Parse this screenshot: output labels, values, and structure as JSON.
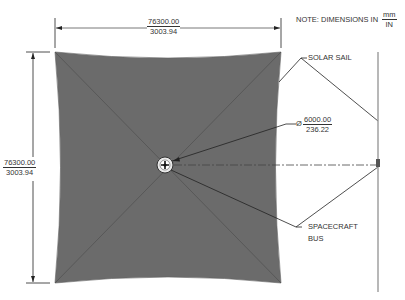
{
  "note": {
    "text": "NOTE: DIMENSIONS IN",
    "unit_top": "mm",
    "unit_bottom": "IN"
  },
  "dimensions": {
    "width": {
      "mm": "76300.00",
      "in": "3003.94"
    },
    "height": {
      "mm": "76300.00",
      "in": "3003.94"
    },
    "bus_diameter": {
      "symbol": "Ø",
      "mm": "6000.00",
      "in": "236.22"
    }
  },
  "callouts": {
    "solar_sail": "SOLAR SAIL",
    "spacecraft_bus_line1": "SPACECRAFT",
    "spacecraft_bus_line2": "BUS"
  },
  "colors": {
    "sail_fill": "#6b6b6b",
    "sail_diagonal": "#5a5a5a",
    "line": "#222222",
    "side_view": "#9a9a9a"
  }
}
